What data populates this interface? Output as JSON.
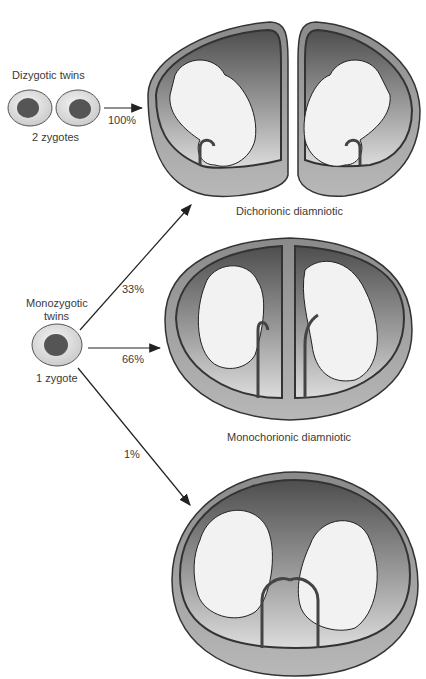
{
  "dizygotic": {
    "title": "Dizygotic twins",
    "subtitle": "2 zygotes",
    "arrow_pct": "100%"
  },
  "monozygotic": {
    "title_line1": "Monozygotic",
    "title_line2": "twins",
    "subtitle": "1 zygote",
    "arrows": [
      {
        "pct": "33%",
        "target": "Dichorionic diamniotic"
      },
      {
        "pct": "66%",
        "target": "Monochorionic diamniotic"
      },
      {
        "pct": "1%",
        "target": "Monochorionic monoamniotic"
      }
    ]
  },
  "diagrams": [
    {
      "label": "Dichorionic diamniotic"
    },
    {
      "label": "Monochorionic diamniotic"
    },
    {
      "label": ""
    }
  ],
  "colors": {
    "outer_wall": "#4a4a4a",
    "cavity_dark": "#5a5a5a",
    "cavity_light": "#d8d8d8",
    "fetus": "#f2f2f2",
    "zygote_nucleus": "#555555",
    "zygote_cell": "#e6e6e6"
  }
}
